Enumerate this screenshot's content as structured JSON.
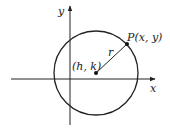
{
  "diagram": {
    "axes": {
      "x_label": "x",
      "y_label": "y"
    },
    "center_label": "(h, k)",
    "point_label": "P(x, y)",
    "radius_label": "r",
    "colors": {
      "stroke": "#222222",
      "background": "#ffffff"
    }
  }
}
